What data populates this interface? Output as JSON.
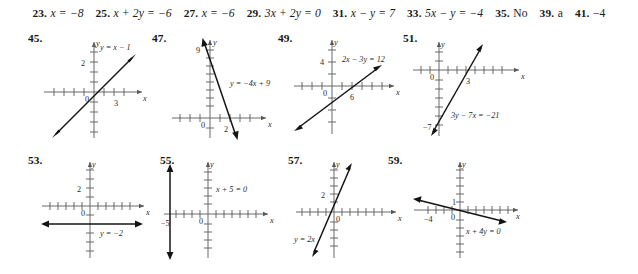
{
  "page": {
    "kind": "textbook-answer-key",
    "background_color": "#ffffff",
    "ink_color": "#1a1a1a"
  },
  "answers_row": [
    {
      "number": "23.",
      "answer": "x = −8",
      "italic": true
    },
    {
      "number": "25.",
      "answer": "x + 2y = −6",
      "italic": true
    },
    {
      "number": "27.",
      "answer": "x = −6",
      "italic": true
    },
    {
      "number": "29.",
      "answer": "3x + 2y = 0",
      "italic": true
    },
    {
      "number": "31.",
      "answer": "x − y = 7",
      "italic": true
    },
    {
      "number": "33.",
      "answer": "5x − y = −4",
      "italic": true
    },
    {
      "number": "35.",
      "answer": "No",
      "italic": false
    },
    {
      "number": "39.",
      "answer": "a",
      "italic": false
    },
    {
      "number": "41.",
      "answer": "−4",
      "italic": false
    }
  ],
  "graphs": [
    {
      "number": "45.",
      "equation": "y = x − 1",
      "type": "line",
      "slope": 1,
      "intercept": -1,
      "x_axis_label": "x",
      "y_axis_label": "y",
      "origin_label": "0",
      "x_tick_label": "3",
      "y_tick_label": "2",
      "x_tick_value": 3,
      "y_tick_value": 2,
      "x_range": [
        -4,
        4
      ],
      "y_range": [
        -4,
        4
      ]
    },
    {
      "number": "47.",
      "equation": "y = −4x + 9",
      "type": "line",
      "slope": -4,
      "intercept": 9,
      "x_axis_label": "x",
      "y_axis_label": "y",
      "origin_label": "0",
      "x_tick_label": "2",
      "y_tick_label": "9",
      "x_tick_value": 2,
      "y_tick_value": 9,
      "x_range": [
        -4,
        4
      ],
      "y_range": [
        -3,
        11
      ]
    },
    {
      "number": "49.",
      "equation": "2x − 3y = 12",
      "type": "line",
      "slope": 0.6667,
      "intercept": -4,
      "x_axis_label": "x",
      "y_axis_label": "y",
      "origin_label": "0",
      "x_tick_label": "6",
      "y_tick_label": "4",
      "x_tick_value": 6,
      "y_tick_value": 4,
      "x_range": [
        -8,
        10
      ],
      "y_range": [
        -8,
        8
      ]
    },
    {
      "number": "51.",
      "equation": "3y − 7x = −21",
      "type": "line",
      "slope": 2.3333,
      "intercept": -7,
      "x_axis_label": "x",
      "y_axis_label": "y",
      "origin_label": "0",
      "x_tick_label": "3",
      "y_tick_label": "−7",
      "x_tick_value": 3,
      "y_tick_value": -7,
      "x_range": [
        -4,
        6
      ],
      "y_range": [
        -10,
        6
      ]
    },
    {
      "number": "53.",
      "equation": "y = −2",
      "type": "horizontal-line",
      "slope": 0,
      "intercept": -2,
      "x_axis_label": "x",
      "y_axis_label": "y",
      "origin_label": "0",
      "x_tick_label": "",
      "y_tick_label": "2",
      "x_tick_value": null,
      "y_tick_value": 2,
      "x_range": [
        -6,
        6
      ],
      "y_range": [
        -6,
        6
      ]
    },
    {
      "number": "55.",
      "equation": "x + 5 = 0",
      "type": "vertical-line",
      "slope": null,
      "intercept": -5,
      "x_axis_label": "x",
      "y_axis_label": "y",
      "origin_label": "0",
      "x_tick_label": "−5",
      "y_tick_label": "",
      "x_tick_value": -5,
      "y_tick_value": null,
      "x_range": [
        -8,
        8
      ],
      "y_range": [
        -7,
        7
      ]
    },
    {
      "number": "57.",
      "equation": "y = 2x",
      "type": "line",
      "slope": 2,
      "intercept": 0,
      "x_axis_label": "x",
      "y_axis_label": "y",
      "origin_label": "0",
      "x_tick_label": "",
      "y_tick_label": "2",
      "x_tick_value": null,
      "y_tick_value": 2,
      "x_range": [
        -7,
        7
      ],
      "y_range": [
        -7,
        7
      ]
    },
    {
      "number": "59.",
      "equation": "x + 4y = 0",
      "type": "line",
      "slope": -0.25,
      "intercept": 0,
      "x_axis_label": "x",
      "y_axis_label": "y",
      "origin_label": "0",
      "x_tick_label": "−4",
      "y_tick_label": "1",
      "x_tick_value": -4,
      "y_tick_value": 1,
      "x_range": [
        -8,
        8
      ],
      "y_range": [
        -7,
        7
      ]
    }
  ]
}
